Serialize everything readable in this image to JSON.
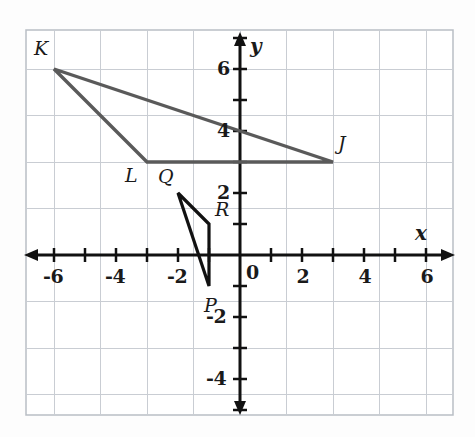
{
  "figure": {
    "kind": "coordinate-plane-graph",
    "background_color": "#fdfdfd",
    "frame": {
      "left": 26,
      "top": 30,
      "right": 453,
      "bottom": 415
    },
    "grid_color": "#c9cdd3",
    "axis_color": "#111111",
    "shape_stroke_color": "#5a5a5a",
    "triangle_pqr_stroke_color": "#111111"
  },
  "chart_data": {
    "type": "scatter",
    "title": "",
    "xlabel": "x",
    "ylabel": "y",
    "xlim": [
      -7,
      7
    ],
    "ylim": [
      -5,
      7
    ],
    "grid": true,
    "legend": "none",
    "x_tick_labels": [
      "-6",
      "-4",
      "-2",
      "0",
      "2",
      "4",
      "6"
    ],
    "x_tick_values": [
      -6,
      -4,
      -2,
      0,
      2,
      4,
      6
    ],
    "y_tick_labels": [
      "6",
      "4",
      "2",
      "-2",
      "-4"
    ],
    "y_tick_values": [
      6,
      4,
      2,
      -2,
      -4
    ],
    "origin_label": "0",
    "minor_tick_step": 1,
    "annotations": [
      {
        "text": "K",
        "x": -6,
        "y": 6
      },
      {
        "text": "L",
        "x": -3,
        "y": 3
      },
      {
        "text": "J",
        "x": 3,
        "y": 3
      },
      {
        "text": "Q",
        "x": -2,
        "y": 2
      },
      {
        "text": "R",
        "x": -1,
        "y": 1
      },
      {
        "text": "P",
        "x": -1,
        "y": -1
      }
    ],
    "series": [
      {
        "name": "triangle JKL",
        "type": "polygon",
        "closed": true,
        "vertices": [
          {
            "label": "K",
            "x": -6,
            "y": 6
          },
          {
            "label": "J",
            "x": 3,
            "y": 3
          },
          {
            "label": "L",
            "x": -3,
            "y": 3
          }
        ]
      },
      {
        "name": "triangle PQR",
        "type": "polygon",
        "closed": true,
        "vertices": [
          {
            "label": "Q",
            "x": -2,
            "y": 2
          },
          {
            "label": "R",
            "x": -1,
            "y": 1
          },
          {
            "label": "P",
            "x": -1,
            "y": -1
          }
        ]
      }
    ]
  },
  "axis_labels": {
    "x": "x",
    "y": "y"
  },
  "x_ticks": [
    {
      "text": "-6",
      "value": -6
    },
    {
      "text": "-4",
      "value": -4
    },
    {
      "text": "-2",
      "value": -2
    },
    {
      "text": "0",
      "value": 0
    },
    {
      "text": "2",
      "value": 2
    },
    {
      "text": "4",
      "value": 4
    },
    {
      "text": "6",
      "value": 6
    }
  ],
  "y_ticks": [
    {
      "text": "6",
      "value": 6
    },
    {
      "text": "4",
      "value": 4
    },
    {
      "text": "2",
      "value": 2
    },
    {
      "text": "-2",
      "value": -2
    },
    {
      "text": "-4",
      "value": -4
    }
  ],
  "point_labels": [
    {
      "text": "K",
      "x": -6,
      "y": 6
    },
    {
      "text": "L",
      "x": -3,
      "y": 3
    },
    {
      "text": "J",
      "x": 3,
      "y": 3
    },
    {
      "text": "Q",
      "x": -2,
      "y": 2
    },
    {
      "text": "R",
      "x": -1,
      "y": 1
    },
    {
      "text": "P",
      "x": -1,
      "y": -1
    }
  ]
}
